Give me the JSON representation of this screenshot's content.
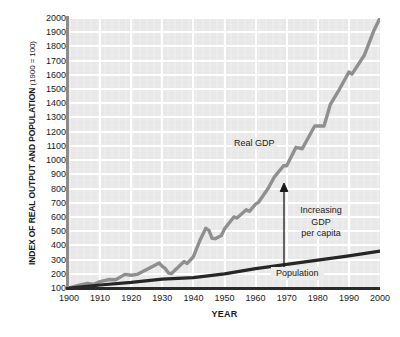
{
  "chart_data": {
    "type": "line",
    "title": "",
    "xlabel": "YEAR",
    "ylabel": "INDEX OF REAL OUTPUT AND POPULATION (1900 = 100)",
    "ylabel_main": "INDEX OF REAL OUTPUT AND POPULATION",
    "ylabel_paren": "(1900 = 100)",
    "xlim": [
      1900,
      2000
    ],
    "ylim": [
      100,
      2000
    ],
    "grid": true,
    "legend_position": "inline-annotations",
    "x_ticks": [
      "1900",
      "1910",
      "1920",
      "1930",
      "1940",
      "1950",
      "1960",
      "1970",
      "1980",
      "1990",
      "2000"
    ],
    "y_ticks": [
      "2000",
      "1900",
      "1800",
      "1700",
      "1600",
      "1500",
      "1400",
      "1300",
      "1200",
      "1100",
      "1000",
      "900",
      "800",
      "700",
      "600",
      "500",
      "400",
      "300",
      "200",
      "100"
    ],
    "series": [
      {
        "name": "Real GDP",
        "color": "#8f8f8f",
        "x": [
          1900,
          1903,
          1906,
          1908,
          1910,
          1913,
          1915,
          1918,
          1920,
          1922,
          1925,
          1929,
          1930,
          1931,
          1932,
          1933,
          1934,
          1935,
          1937,
          1938,
          1940,
          1942,
          1944,
          1945,
          1946,
          1947,
          1949,
          1950,
          1953,
          1954,
          1957,
          1958,
          1960,
          1961,
          1964,
          1966,
          1969,
          1970,
          1973,
          1975,
          1979,
          1982,
          1984,
          1987,
          1990,
          1991,
          1995,
          1998,
          2000
        ],
        "values": [
          100,
          118,
          132,
          126,
          145,
          160,
          158,
          196,
          190,
          196,
          230,
          276,
          252,
          236,
          205,
          202,
          224,
          244,
          286,
          273,
          320,
          430,
          520,
          505,
          450,
          447,
          470,
          516,
          600,
          592,
          650,
          640,
          690,
          705,
          800,
          880,
          960,
          960,
          1090,
          1080,
          1240,
          1240,
          1390,
          1500,
          1620,
          1605,
          1740,
          1910,
          2000
        ]
      },
      {
        "name": "Population",
        "color": "#262626",
        "x": [
          1900,
          1910,
          1920,
          1930,
          1940,
          1950,
          1960,
          1970,
          1980,
          1990,
          2000
        ],
        "values": [
          100,
          121,
          139,
          162,
          173,
          199,
          236,
          266,
          296,
          326,
          360
        ]
      }
    ],
    "annotations": [
      {
        "id": "real-gdp",
        "text": "Real GDP"
      },
      {
        "id": "increasing-gdp-per-capita",
        "line1": "Increasing",
        "line2": "GDP",
        "line3": "per capita"
      },
      {
        "id": "population",
        "text": "Population"
      }
    ]
  }
}
